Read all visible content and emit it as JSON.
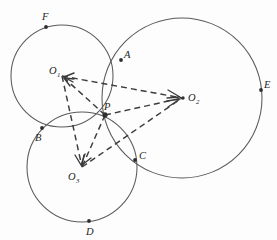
{
  "figure": {
    "background_color": "#fdfdfd",
    "stroke_color": "#5a5a5a",
    "dash_color": "#3c3c3c",
    "label_color": "#1e1e1e"
  },
  "circles": [
    {
      "id": "circle-o1",
      "center_label": "O",
      "center_subscript": "1",
      "cx": 62,
      "cy": 76,
      "r": 51
    },
    {
      "id": "circle-o2",
      "center_label": "O",
      "center_subscript": "2",
      "cx": 182,
      "cy": 98,
      "r": 80
    },
    {
      "id": "circle-o3",
      "center_label": "O",
      "center_subscript": "3",
      "cx": 82,
      "cy": 167,
      "r": 55
    }
  ],
  "centers": [
    {
      "name": "O1",
      "label": "O",
      "subscript": "1",
      "x": 62,
      "y": 76,
      "label_x": 49,
      "label_y": 74,
      "dot": false
    },
    {
      "name": "O2",
      "label": "O",
      "subscript": "2",
      "x": 182,
      "y": 98,
      "label_x": 188,
      "label_y": 101,
      "dot": true
    },
    {
      "name": "O3",
      "label": "O",
      "subscript": "3",
      "x": 82,
      "y": 167,
      "label_x": 68,
      "label_y": 180,
      "dot": false
    }
  ],
  "points": [
    {
      "name": "A",
      "label": "A",
      "x": 121,
      "y": 60,
      "label_x": 124,
      "label_y": 58
    },
    {
      "name": "B",
      "label": "B",
      "x": 42,
      "y": 128,
      "label_x": 35,
      "label_y": 141
    },
    {
      "name": "C",
      "label": "C",
      "x": 135,
      "y": 160,
      "label_x": 139,
      "label_y": 159
    },
    {
      "name": "D",
      "label": "D",
      "x": 89,
      "y": 221,
      "label_x": 86,
      "label_y": 235
    },
    {
      "name": "E",
      "label": "E",
      "x": 261,
      "y": 90,
      "label_x": 264,
      "label_y": 88
    },
    {
      "name": "F",
      "label": "F",
      "x": 46,
      "y": 27,
      "label_x": 42,
      "label_y": 20
    },
    {
      "name": "P",
      "label": "P",
      "x": 105,
      "y": 115,
      "label_x": 104,
      "label_y": 110
    }
  ],
  "connectors": [
    {
      "name": "o1-to-o2",
      "from": "O1",
      "to": "O2",
      "x1": 62,
      "y1": 76,
      "x2": 182,
      "y2": 98,
      "arrow_at": "both"
    },
    {
      "name": "o1-to-o3",
      "from": "O1",
      "to": "O3",
      "x1": 62,
      "y1": 76,
      "x2": 82,
      "y2": 167,
      "arrow_at": "both"
    },
    {
      "name": "o3-to-o2",
      "from": "O3",
      "to": "O2",
      "x1": 82,
      "y1": 167,
      "x2": 182,
      "y2": 98,
      "arrow_at": "both"
    },
    {
      "name": "p-to-o1",
      "from": "P",
      "to": "O1",
      "x1": 105,
      "y1": 115,
      "x2": 62,
      "y2": 76,
      "arrow_at": "end"
    },
    {
      "name": "p-to-o2",
      "from": "P",
      "to": "O2",
      "x1": 105,
      "y1": 115,
      "x2": 182,
      "y2": 98,
      "arrow_at": "end"
    },
    {
      "name": "p-to-o3",
      "from": "P",
      "to": "O3",
      "x1": 105,
      "y1": 115,
      "x2": 82,
      "y2": 167,
      "arrow_at": "end"
    }
  ]
}
